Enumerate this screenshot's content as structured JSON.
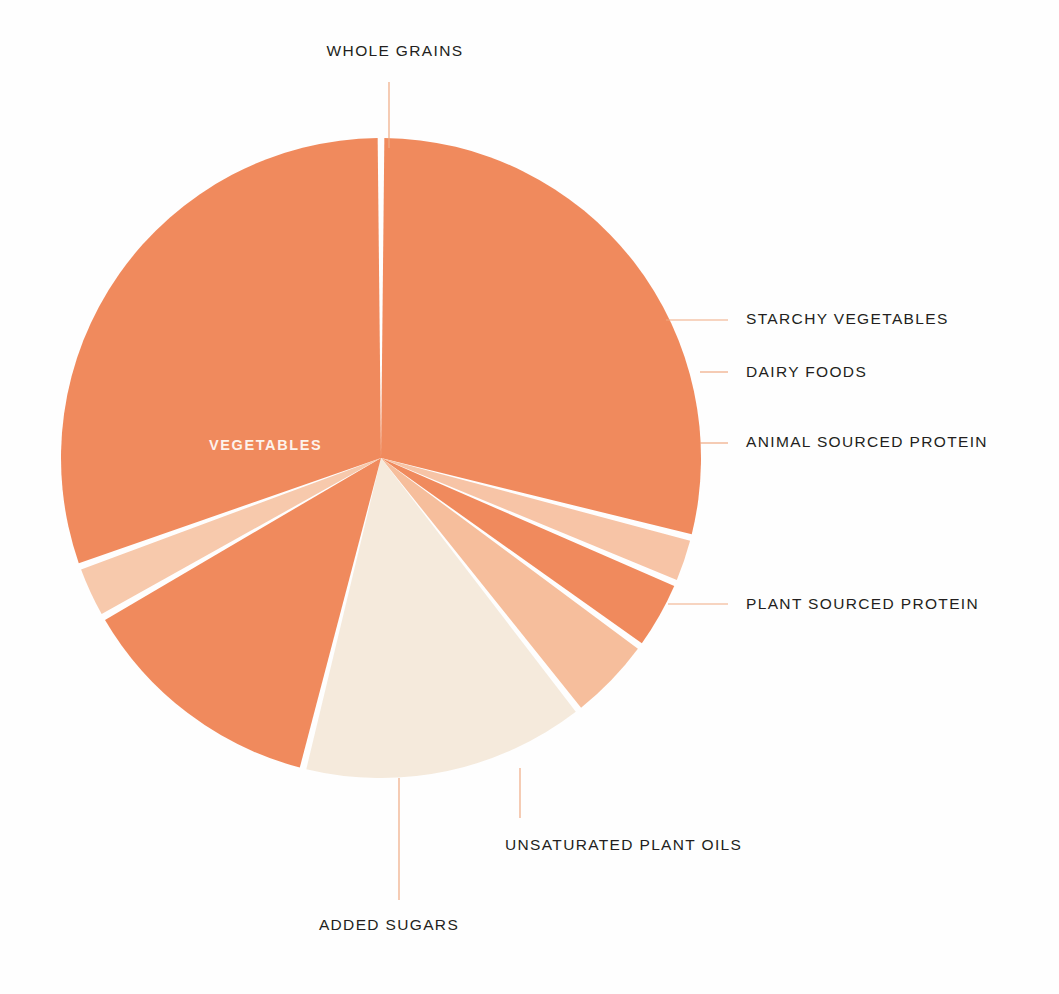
{
  "chart_data": {
    "type": "pie",
    "title": "",
    "subtitle": "",
    "xlabel": "",
    "ylabel": "",
    "legend_position": "callout-labels",
    "grid": false,
    "center": {
      "x": 381,
      "y": 458
    },
    "radius": 320,
    "start_angle_deg": -90,
    "direction": "clockwise",
    "slice_gap_deg": 1.2,
    "labels": [
      "WHOLE GRAINS",
      "STARCHY VEGETABLES",
      "DAIRY FOODS",
      "ANIMAL SOURCED PROTEIN",
      "PLANT SOURCED PROTEIN",
      "UNSATURATED PLANT OILS",
      "ADDED SUGARS",
      "VEGETABLES"
    ],
    "values": [
      29.0,
      2.4,
      3.6,
      4.4,
      14.5,
      12.8,
      2.8,
      30.5
    ],
    "colors": [
      "#F08A5D",
      "#F7C4A6",
      "#F08A5D",
      "#F6BE9C",
      "#F5EADC",
      "#F08A5D",
      "#F7C9AC",
      "#F08A5D"
    ],
    "slices": [
      {
        "label": "WHOLE GRAINS",
        "value": 29.0,
        "color": "#F08A5D",
        "start_deg": -90.0,
        "end_deg": 14.4,
        "label_placement": "outside-top",
        "leader": {
          "type": "vertical",
          "from_x": 389,
          "from_y": 148,
          "to_x": 389,
          "to_y": 82
        },
        "text_x": 395,
        "text_y": 50,
        "text_anchor": "middle"
      },
      {
        "label": "STARCHY VEGETABLES",
        "value": 2.4,
        "color": "#F7C4A6",
        "start_deg": 14.4,
        "end_deg": 23.0,
        "label_placement": "right",
        "leader": {
          "type": "horizontal",
          "from_x": 666,
          "from_y": 320,
          "to_x": 728,
          "to_y": 320
        },
        "text_x": 746,
        "text_y": 313,
        "text_anchor": "start"
      },
      {
        "label": "DAIRY FOODS",
        "value": 3.6,
        "color": "#F08A5D",
        "start_deg": 23.0,
        "end_deg": 36.0,
        "label_placement": "right",
        "leader": {
          "type": "horizontal",
          "from_x": 700,
          "from_y": 372,
          "to_x": 728,
          "to_y": 372
        },
        "text_x": 746,
        "text_y": 365,
        "text_anchor": "start"
      },
      {
        "label": "ANIMAL SOURCED PROTEIN",
        "value": 4.4,
        "color": "#F6BE9C",
        "start_deg": 36.0,
        "end_deg": 51.9,
        "label_placement": "right",
        "leader": {
          "type": "horizontal",
          "from_x": 700,
          "from_y": 443,
          "to_x": 728,
          "to_y": 443
        },
        "text_x": 746,
        "text_y": 436,
        "text_anchor": "start"
      },
      {
        "label": "PLANT SOURCED PROTEIN",
        "value": 14.5,
        "color": "#F5EADC",
        "start_deg": 51.9,
        "end_deg": 104.1,
        "label_placement": "right",
        "leader": {
          "type": "horizontal",
          "from_x": 668,
          "from_y": 604,
          "to_x": 728,
          "to_y": 604
        },
        "text_x": 746,
        "text_y": 597,
        "text_anchor": "start"
      },
      {
        "label": "UNSATURATED PLANT OILS",
        "value": 12.8,
        "color": "#F08A5D",
        "start_deg": 104.1,
        "end_deg": 150.2,
        "label_placement": "bottom",
        "leader": {
          "type": "vertical",
          "from_x": 520,
          "from_y": 768,
          "to_x": 520,
          "to_y": 818
        },
        "text_x": 505,
        "text_y": 838,
        "text_anchor": "start"
      },
      {
        "label": "ADDED SUGARS",
        "value": 2.8,
        "color": "#F7C9AC",
        "start_deg": 150.2,
        "end_deg": 160.2,
        "label_placement": "bottom",
        "leader": {
          "type": "vertical",
          "from_x": 399,
          "from_y": 778,
          "to_x": 399,
          "to_y": 900
        },
        "text_x": 389,
        "text_y": 922,
        "text_anchor": "middle"
      },
      {
        "label": "VEGETABLES",
        "value": 30.5,
        "color": "#F08A5D",
        "start_deg": 160.2,
        "end_deg": 270.0,
        "label_placement": "inside",
        "leader": null,
        "text_x": 209,
        "text_y": 445,
        "text_anchor": "start"
      }
    ],
    "palette": {
      "primary_orange": "#F08A5D",
      "light_salmon": "#F7C4A6",
      "mid_salmon": "#F6BE9C",
      "cream": "#F5EADC",
      "pale_peach": "#F7C9AC",
      "leader_line": "#EFA982",
      "label_text": "#231f20",
      "inside_label_text": "#FDF3EC",
      "background": "#FFFFFF"
    }
  },
  "labels": {
    "whole_grains": "WHOLE GRAINS",
    "starchy_vegetables": "STARCHY VEGETABLES",
    "dairy_foods": "DAIRY FOODS",
    "animal_sourced_protein": "ANIMAL SOURCED PROTEIN",
    "plant_sourced_protein": "PLANT SOURCED PROTEIN",
    "unsaturated_plant_oils": "UNSATURATED PLANT OILS",
    "added_sugars": "ADDED SUGARS",
    "vegetables": "VEGETABLES"
  }
}
